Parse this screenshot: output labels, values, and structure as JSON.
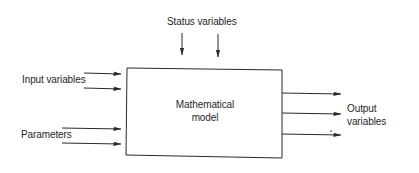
{
  "diagram": {
    "box_label_line1": "Mathematical",
    "box_label_line2": "model",
    "status_label": "Status variables",
    "input_label": "Input variables",
    "parameters_label": "Parameters",
    "output_label_line1": "Output",
    "output_label_line2": "variables",
    "colors": {
      "line": "#2a2a2a",
      "text": "#1f1f1f",
      "background": "#ffffff"
    },
    "arrows": {
      "status": 2,
      "input": 2,
      "parameters": 2,
      "output": 3
    }
  }
}
